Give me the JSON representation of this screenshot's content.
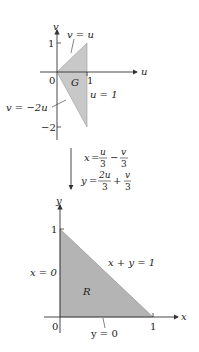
{
  "top_plot": {
    "axis_labels": {
      "horizontal": "u",
      "vertical": "v"
    },
    "ticks": {
      "origin": "0",
      "u1": "1",
      "v1": "1",
      "vneg2": "−2"
    },
    "region_label": "G",
    "boundaries": {
      "upper": "v = u",
      "lower": "v = −2u",
      "right": "u = 1"
    },
    "fill_color": "#c8c8c8",
    "vertices": [
      [
        0,
        0
      ],
      [
        1,
        1
      ],
      [
        1,
        -2
      ]
    ]
  },
  "transform": {
    "x_lhs": "x",
    "x_frac1_num": "u",
    "x_frac1_den": "3",
    "x_op": "−",
    "x_frac2_num": "v",
    "x_frac2_den": "3",
    "y_lhs": "y",
    "y_frac1_num": "2u",
    "y_frac1_den": "3",
    "y_op": "+",
    "y_frac2_num": "v",
    "y_frac2_den": "3"
  },
  "bottom_plot": {
    "axis_labels": {
      "horizontal": "x",
      "vertical": "y"
    },
    "ticks": {
      "origin": "0",
      "x1": "1",
      "y1": "1"
    },
    "region_label": "R",
    "boundaries": {
      "hyp": "x + y = 1",
      "left": "x = 0",
      "bottom": "y = 0"
    },
    "fill_color": "#b4b4b4",
    "vertices": [
      [
        0,
        0
      ],
      [
        1,
        0
      ],
      [
        0,
        1
      ]
    ]
  }
}
